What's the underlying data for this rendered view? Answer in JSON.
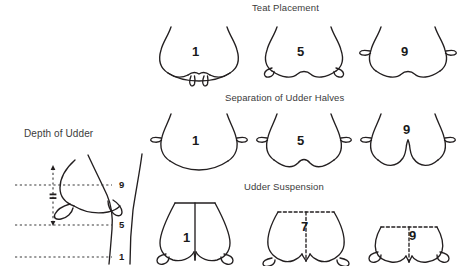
{
  "figure": {
    "width": 460,
    "height": 266,
    "background_color": "#ffffff",
    "line_color": "#231f20",
    "type": "linear-trait-scoring-diagram"
  },
  "sections": [
    {
      "key": "teat_placement",
      "title": "Teat Placement",
      "scores": [
        "1",
        "5",
        "9"
      ],
      "view": "rear",
      "description": "teats move from close together (1) to wide apart (9)"
    },
    {
      "key": "separation_of_udder_halves",
      "title": "Separation of Udder Halves",
      "scores": [
        "1",
        "5",
        "9"
      ],
      "view": "rear",
      "description": "udder floor goes from flat (1) to strongly cleft (9)"
    },
    {
      "key": "udder_suspension",
      "title": "Udder Suspension",
      "scores": [
        "1",
        "7",
        "9"
      ],
      "view": "rear",
      "description": "udder floor goes from deep/low (1) to high above hock (9)"
    },
    {
      "key": "depth_of_udder",
      "title": "Depth of Udder",
      "scores": [
        "9",
        "5",
        "1"
      ],
      "view": "side",
      "description": "reference lines mark udder floor height relative to hock"
    }
  ],
  "depth_of_udder": {
    "title": "Depth of Udder",
    "axis_labels": [
      {
        "value": "9",
        "y": 185
      },
      {
        "value": "5",
        "y": 225
      },
      {
        "value": "1",
        "y": 257
      }
    ]
  },
  "teat_placement": {
    "title": "Teat Placement",
    "figures": [
      {
        "score": "1",
        "label_x": 196,
        "label_y": 51
      },
      {
        "score": "5",
        "label_x": 300,
        "label_y": 51
      },
      {
        "score": "9",
        "label_x": 404,
        "label_y": 51
      }
    ]
  },
  "separation_of_udder_halves": {
    "title": "Separation of Udder Halves",
    "figures": [
      {
        "score": "1",
        "label_x": 196,
        "label_y": 140
      },
      {
        "score": "5",
        "label_x": 300,
        "label_y": 140
      },
      {
        "score": "9",
        "label_x": 404,
        "label_y": 131
      }
    ]
  },
  "udder_suspension": {
    "title": "Udder Suspension",
    "figures": [
      {
        "score": "1",
        "label_x": 187,
        "label_y": 238
      },
      {
        "score": "7",
        "label_x": 305,
        "label_y": 227
      },
      {
        "score": "9",
        "label_x": 412,
        "label_y": 236
      }
    ]
  }
}
